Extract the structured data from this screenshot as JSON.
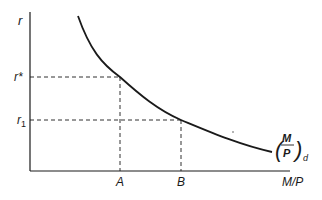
{
  "diagram": {
    "y_axis_label": "r",
    "x_axis_label": "M/P",
    "y_ticks": [
      {
        "label": "r*",
        "id": "r-star"
      },
      {
        "label": "r",
        "sub": "1",
        "id": "r-1"
      }
    ],
    "x_ticks": [
      {
        "label": "A"
      },
      {
        "label": "B"
      }
    ],
    "curve_label": {
      "num": "M",
      "den": "P",
      "sub": "d"
    },
    "colors": {
      "ink": "#1a1a1a",
      "background": "#ffffff"
    }
  }
}
